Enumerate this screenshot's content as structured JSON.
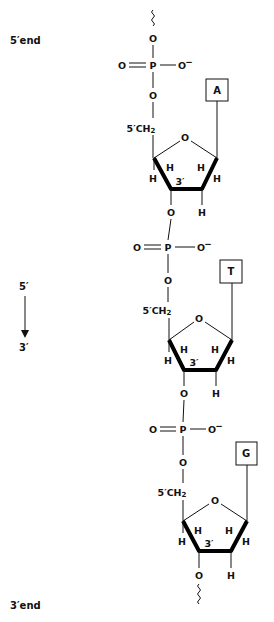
{
  "labels": {
    "five_end": "5′end",
    "three_end": "3′end",
    "direction_top": "5′",
    "direction_bottom": "3′"
  },
  "atoms": {
    "oxygen": "O",
    "phosphorus": "P",
    "oxygen_minus": "O",
    "minus_sign": "−",
    "hydrogen": "H",
    "ch2_prefix": "5′CH",
    "ch2_subscript": "2",
    "three_prime": "3′"
  },
  "nucleotides": [
    {
      "base": "A"
    },
    {
      "base": "T"
    },
    {
      "base": "G"
    }
  ],
  "colors": {
    "ink": "#111111",
    "background": "#ffffff"
  }
}
